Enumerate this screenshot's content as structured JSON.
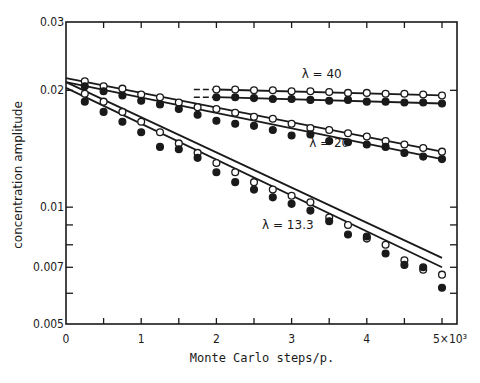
{
  "chart_data": {
    "type": "scatter",
    "title": "",
    "xlabel": "Monte Carlo steps/p.",
    "ylabel": "concentration amplitude",
    "xlim": [
      0,
      5200
    ],
    "ylim": [
      0.005,
      0.03
    ],
    "yscale": "log",
    "grid": false,
    "legend": "inline annotations",
    "x_ticks": [
      0,
      1000,
      2000,
      3000,
      4000,
      5000
    ],
    "x_tick_labels": [
      "0",
      "1",
      "2",
      "3",
      "4",
      "5×10³"
    ],
    "y_ticks": [
      0.03,
      0.02,
      0.01,
      0.007,
      0.005
    ],
    "y_tick_labels": [
      "0.03",
      "0.02",
      "0.01",
      "0.007",
      "0.005"
    ],
    "annotations": [
      {
        "text": "λ = 40",
        "x": 3400,
        "y": 0.0215
      },
      {
        "text": "λ = 20",
        "x": 3500,
        "y": 0.0143
      },
      {
        "text": "λ = 13.3",
        "x": 2950,
        "y": 0.0088
      }
    ],
    "series": [
      {
        "name": "λ=40 open",
        "marker": "open",
        "x": [
          2000,
          2250,
          2500,
          2750,
          3000,
          3250,
          3500,
          3750,
          4000,
          4250,
          4500,
          4750,
          5000
        ],
        "y": [
          0.0201,
          0.0201,
          0.02,
          0.02,
          0.0199,
          0.0199,
          0.0198,
          0.0197,
          0.0197,
          0.0196,
          0.0196,
          0.0195,
          0.0194
        ]
      },
      {
        "name": "λ=40 filled",
        "marker": "filled",
        "x": [
          2000,
          2250,
          2500,
          2750,
          3000,
          3250,
          3500,
          3750,
          4000,
          4250,
          4500,
          4750,
          5000
        ],
        "y": [
          0.0192,
          0.0192,
          0.0191,
          0.019,
          0.019,
          0.0189,
          0.0188,
          0.0189,
          0.0187,
          0.0187,
          0.0186,
          0.0186,
          0.0185
        ]
      },
      {
        "name": "λ=20 open",
        "marker": "open",
        "x": [
          250,
          500,
          750,
          1000,
          1250,
          1500,
          1750,
          2000,
          2250,
          2500,
          2750,
          3000,
          3250,
          3500,
          3750,
          4000,
          4250,
          4500,
          4750,
          5000
        ],
        "y": [
          0.0211,
          0.0205,
          0.0202,
          0.0195,
          0.0192,
          0.0186,
          0.0181,
          0.0179,
          0.0175,
          0.0171,
          0.0169,
          0.0164,
          0.016,
          0.0158,
          0.0155,
          0.0152,
          0.0148,
          0.0145,
          0.0142,
          0.0139
        ]
      },
      {
        "name": "λ=20 filled",
        "marker": "filled",
        "x": [
          250,
          500,
          750,
          1000,
          1250,
          1500,
          1750,
          2000,
          2250,
          2500,
          2750,
          3000,
          3250,
          3500,
          3750,
          4000,
          4250,
          4500,
          4750,
          5000
        ],
        "y": [
          0.0205,
          0.0199,
          0.0194,
          0.0188,
          0.0184,
          0.0179,
          0.0173,
          0.0167,
          0.0164,
          0.0162,
          0.0158,
          0.0153,
          0.0154,
          0.0148,
          0.0147,
          0.0145,
          0.0143,
          0.0138,
          0.0135,
          0.0133
        ]
      },
      {
        "name": "λ=13.3 open",
        "marker": "open",
        "x": [
          250,
          500,
          750,
          1000,
          1250,
          1500,
          1750,
          2000,
          2250,
          2500,
          2750,
          3000,
          3250,
          3500,
          3750,
          4000,
          4250,
          4500,
          4750,
          5000
        ],
        "y": [
          0.0196,
          0.0187,
          0.0176,
          0.0166,
          0.0156,
          0.0146,
          0.0138,
          0.013,
          0.0123,
          0.0116,
          0.0111,
          0.0107,
          0.0103,
          0.0094,
          0.009,
          0.0083,
          0.008,
          0.0073,
          0.0069,
          0.0067
        ]
      },
      {
        "name": "λ=13.3 filled",
        "marker": "filled",
        "x": [
          250,
          500,
          750,
          1000,
          1250,
          1500,
          1750,
          2000,
          2250,
          2500,
          2750,
          3000,
          3250,
          3500,
          3750,
          4000,
          4250,
          4500,
          4750,
          5000
        ],
        "y": [
          0.0187,
          0.0176,
          0.0166,
          0.0156,
          0.0143,
          0.0141,
          0.0134,
          0.0123,
          0.0116,
          0.0111,
          0.0106,
          0.0102,
          0.0098,
          0.0092,
          0.0085,
          0.0084,
          0.0076,
          0.0071,
          0.007,
          0.0062
        ]
      }
    ],
    "fit_lines": [
      {
        "name": "λ=40 open fit",
        "x": [
          2000,
          5000
        ],
        "y": [
          0.0201,
          0.0194
        ],
        "dashed_lead_in": [
          1700,
          2000
        ]
      },
      {
        "name": "λ=40 filled fit",
        "x": [
          2000,
          5000
        ],
        "y": [
          0.0192,
          0.0185
        ],
        "dashed_lead_in": [
          1700,
          2000
        ]
      },
      {
        "name": "λ=20 open fit",
        "x": [
          0,
          5000
        ],
        "y": [
          0.0215,
          0.0139
        ]
      },
      {
        "name": "λ=20 filled fit",
        "x": [
          0,
          5000
        ],
        "y": [
          0.021,
          0.0133
        ]
      },
      {
        "name": "λ=13.3 open fit",
        "x": [
          0,
          5000
        ],
        "y": [
          0.021,
          0.0074
        ]
      },
      {
        "name": "λ=13.3 filled fit",
        "x": [
          0,
          5000
        ],
        "y": [
          0.0203,
          0.007
        ]
      }
    ]
  }
}
